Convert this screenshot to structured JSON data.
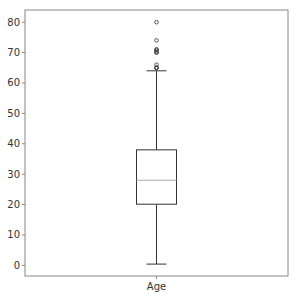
{
  "chart_data": {
    "type": "box",
    "title": "",
    "xlabel": "",
    "ylabel": "",
    "categories": [
      "Age"
    ],
    "ylim": [
      -3.5,
      84
    ],
    "yticks": [
      0,
      10,
      20,
      30,
      40,
      50,
      60,
      70,
      80
    ],
    "ytick_labels": [
      "0",
      "10",
      "20",
      "30",
      "40",
      "50",
      "60",
      "70",
      "80"
    ],
    "grid": false,
    "legend": "none",
    "series": [
      {
        "name": "Age",
        "whisker_low": 0.42,
        "q1": 20.125,
        "median": 28,
        "q3": 38,
        "whisker_high": 64,
        "outliers": [
          65,
          65,
          65,
          66,
          70,
          70,
          70.5,
          71,
          71,
          74,
          80
        ]
      }
    ],
    "colors": {
      "box": "#333333",
      "median": "#aaaaaa",
      "frame": "#888888",
      "outlier": "#444444"
    }
  }
}
